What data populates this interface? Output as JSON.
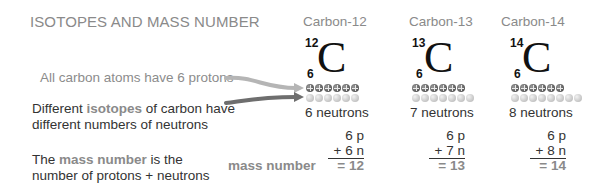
{
  "title": "ISOTOPES AND MASS NUMBER",
  "notes": {
    "protons": "All carbon atoms have 6 protons",
    "isotopes_pre": "Different ",
    "isotopes_hl": "isotopes",
    "isotopes_post": " of carbon have",
    "isotopes_line2": "different numbers of neutrons",
    "mass_pre": "The ",
    "mass_hl": "mass number",
    "mass_post": " is the",
    "mass_line2": "number of protons + neutrons"
  },
  "mass_number_label": "mass number",
  "element_symbol": "C",
  "isotopes": [
    {
      "name": "Carbon-12",
      "mass": "12",
      "atomic": "6",
      "protons": 6,
      "neutrons": 6,
      "neutron_label": "6 neutrons",
      "p_line": "6 p",
      "n_line": "+ 6 n",
      "total": "= 12"
    },
    {
      "name": "Carbon-13",
      "mass": "13",
      "atomic": "6",
      "protons": 6,
      "neutrons": 7,
      "neutron_label": "7 neutrons",
      "p_line": "6 p",
      "n_line": "+ 7 n",
      "total": "= 13"
    },
    {
      "name": "Carbon-14",
      "mass": "14",
      "atomic": "6",
      "protons": 6,
      "neutrons": 8,
      "neutron_label": "8 neutrons",
      "p_line": "6 p",
      "n_line": "+ 8 n",
      "total": "= 14"
    }
  ],
  "colors": {
    "accent_gray": "#8a8a8a",
    "text_dark": "#333333",
    "arrow_light": "#b5b5b5",
    "arrow_dark": "#6e6e6e"
  }
}
